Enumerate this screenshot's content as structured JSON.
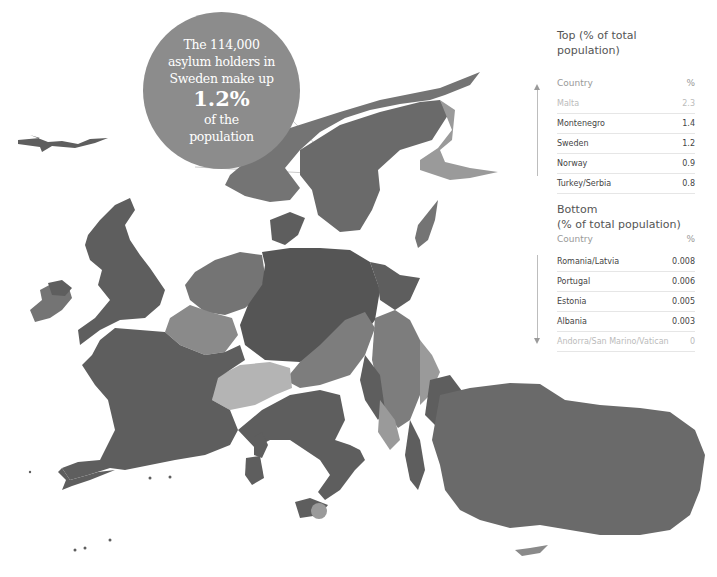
{
  "callout": {
    "line1": "The 114,000",
    "line2": "asylum holders in",
    "line3": "Sweden make up",
    "value": "1.2%",
    "line4": "of the",
    "line5": "population"
  },
  "top_table": {
    "title": "Top (% of total population)",
    "col_country": "Country",
    "col_percent": "%",
    "rows": [
      {
        "country": "Malta",
        "value": "2.3"
      },
      {
        "country": "Montenegro",
        "value": "1.4"
      },
      {
        "country": "Sweden",
        "value": "1.2"
      },
      {
        "country": "Norway",
        "value": "0.9"
      },
      {
        "country": "Turkey/Serbia",
        "value": "0.8"
      }
    ]
  },
  "bottom_table": {
    "title_line1": "Bottom",
    "title_line2": "(% of total population)",
    "col_country": "Country",
    "col_percent": "%",
    "rows": [
      {
        "country": "Romania/Latvia",
        "value": "0.008"
      },
      {
        "country": "Portugal",
        "value": "0.006"
      },
      {
        "country": "Estonia",
        "value": "0.005"
      },
      {
        "country": "Albania",
        "value": "0.003"
      },
      {
        "country": "Andorra/San Marino/Vatican",
        "value": "0"
      }
    ]
  },
  "map": {
    "colors": {
      "dark": "#5e5e5e",
      "medium": "#747474",
      "light": "#9a9a9a",
      "lightest": "#b4b4b4",
      "callout": "#8c8c8c"
    }
  }
}
